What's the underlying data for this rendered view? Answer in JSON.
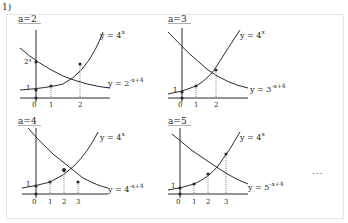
{
  "problem_label": "1)",
  "ellipsis": "...",
  "colors": {
    "ink": "#2a2a2a",
    "frame": "#e4e4e4",
    "dashed": "#888888"
  },
  "panels": [
    {
      "a_label": "a=2",
      "curve1_label": "y = 4",
      "curve1_exp": "x",
      "curve2_label": "y = 2",
      "curve2_exp": "-x+4",
      "y_intercept_labels": [
        "1",
        "2⁴"
      ],
      "x_ticks": [
        "0",
        "1",
        "2"
      ]
    },
    {
      "a_label": "a=3",
      "curve1_label": "y = 4",
      "curve1_exp": "x",
      "curve2_label": "y = 3",
      "curve2_exp": "-x+4",
      "y_intercept_labels": [
        "1"
      ],
      "x_ticks": [
        "0",
        "1",
        "2"
      ]
    },
    {
      "a_label": "a=4",
      "curve1_label": "y = 4",
      "curve1_exp": "x",
      "curve2_label": "y = 4",
      "curve2_exp": "-x+4",
      "y_intercept_labels": [
        "1"
      ],
      "x_ticks": [
        "0",
        "1",
        "2",
        "3"
      ]
    },
    {
      "a_label": "a=5",
      "curve1_label": "y = 4",
      "curve1_exp": "x",
      "curve2_label": "y = 5",
      "curve2_exp": "-x+4",
      "y_intercept_labels": [
        "1"
      ],
      "x_ticks": [
        "0",
        "1",
        "2",
        "3"
      ]
    }
  ]
}
